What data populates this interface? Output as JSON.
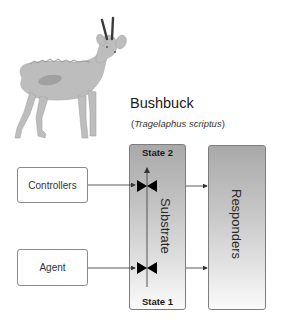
{
  "species": {
    "common_name": "Bushbuck",
    "latin_open": "(",
    "latin_name": "Tragelaphus scriptus",
    "latin_close": ")"
  },
  "illustration": {
    "subject": "bushbuck-antelope",
    "fill_color": "#bdbdbd",
    "horn_color": "#3a3a3a"
  },
  "diagram": {
    "inputs": [
      {
        "label": "Controllers"
      },
      {
        "label": "Agent"
      }
    ],
    "substrate": {
      "label": "Substrate",
      "state_top": "State 2",
      "state_bottom": "State 1",
      "transition_arrow": "State 1 to State 2",
      "valves": 2
    },
    "output": {
      "label": "Responders"
    },
    "colors": {
      "box_border": "#7d7d7d",
      "gradient_top": "#a9a9a9",
      "gradient_bottom": "#fbfbfb",
      "arrow": "#333333",
      "valve": "#000000"
    }
  }
}
